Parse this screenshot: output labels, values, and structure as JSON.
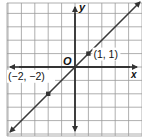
{
  "chart_data": {
    "type": "line",
    "title": "",
    "xlabel": "x",
    "ylabel": "y",
    "origin_label": "O",
    "xlim": [
      -5,
      5
    ],
    "ylim": [
      -5,
      5
    ],
    "grid": true,
    "series": [
      {
        "name": "y = x",
        "equation": "y = x",
        "x": [
          -5,
          5
        ],
        "y": [
          -5,
          5
        ],
        "arrows_both_ends": true
      }
    ],
    "points": [
      {
        "x": 1,
        "y": 1,
        "label": "(1, 1)"
      },
      {
        "x": -2,
        "y": -2,
        "label": "(−2, −2)"
      }
    ]
  },
  "colors": {
    "grid": "#9a9a9a",
    "axis": "#2a2a2a",
    "line": "#3a3a3a",
    "point": "#333333",
    "text": "#111111",
    "background": "#ffffff"
  }
}
